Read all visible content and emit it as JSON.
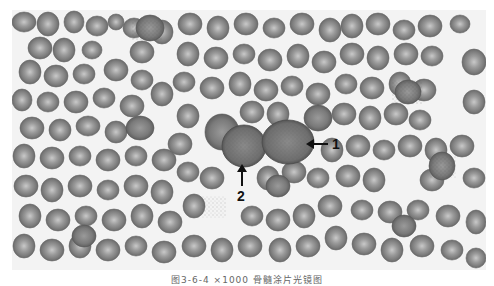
{
  "figure": {
    "type": "blood smear micrograph",
    "color_mode": "grayscale",
    "annotations": [
      {
        "label": "1",
        "arrow_direction": "left"
      },
      {
        "label": "2",
        "arrow_direction": "up"
      }
    ],
    "caption": "图3-6-4 ×1000  骨髓涂片光镜图"
  }
}
